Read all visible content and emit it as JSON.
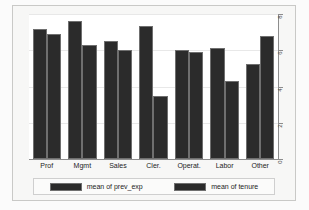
{
  "chart_data": {
    "type": "bar",
    "title": "",
    "subtitle": "",
    "xlabel": "",
    "ylabel": "",
    "grid": true,
    "legend_position": "bottom",
    "y_axis_side": "right",
    "ylim": [
      0,
      8
    ],
    "yticks": [
      0,
      2,
      4,
      6,
      8
    ],
    "ytick_labels": [
      "0",
      "2",
      "4",
      "6",
      "8"
    ],
    "categories": [
      "Prof",
      "Mgmt",
      "Sales",
      "Cler.",
      "Operat.",
      "Labor",
      "Other"
    ],
    "series": [
      {
        "name": "mean of prev_exp",
        "values": [
          7.2,
          7.6,
          6.5,
          7.35,
          6.0,
          6.15,
          5.25
        ]
      },
      {
        "name": "mean of tenure",
        "values": [
          6.9,
          6.3,
          6.0,
          3.5,
          5.9,
          4.3,
          6.8
        ]
      }
    ]
  },
  "legend": {
    "entries": [
      {
        "label": "mean of prev_exp"
      },
      {
        "label": "mean of tenure"
      }
    ]
  },
  "colors": {
    "bar_fill": "#2b2b2b",
    "bar_edge": "#6f6f6f",
    "axis": "#8d8d8d",
    "grid": "#e8e8e8",
    "plot_background": "#ffffff",
    "graph_background": "#f7f7f6",
    "page_background": "#fbfbfb",
    "text": "#242424"
  }
}
